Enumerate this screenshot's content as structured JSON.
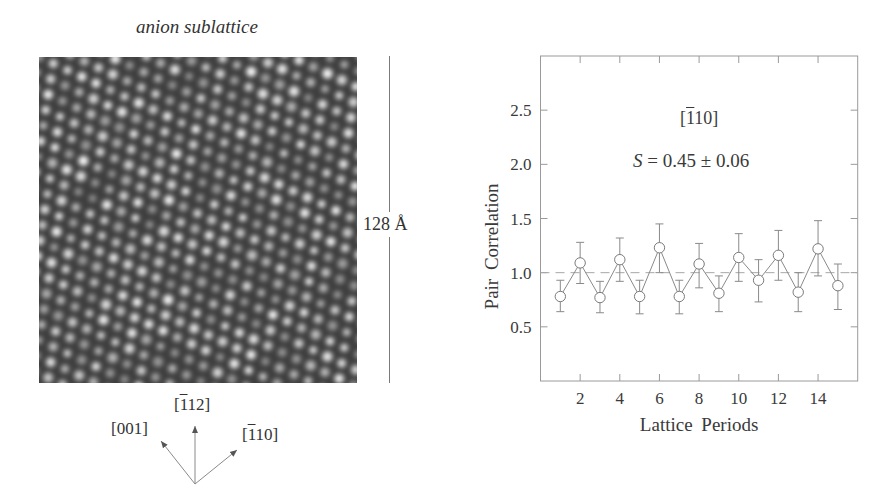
{
  "figure": {
    "left_panel": {
      "title": "anion sublattice",
      "scale_bar_label": "128 Å",
      "directions": [
        {
          "label_prefix": "[",
          "overline_digit": "1",
          "label_rest": "12]",
          "text": "[-112]"
        },
        {
          "label_prefix": "[",
          "overline_digit": "",
          "label_rest": "001]",
          "text": "[001]"
        },
        {
          "label_prefix": "[",
          "overline_digit": "1",
          "label_rest": "10]",
          "text": "[-110]"
        }
      ]
    },
    "right_panel": {
      "annotation_direction": {
        "prefix": "[",
        "overline_digit": "1",
        "rest": "10]"
      },
      "annotation_order": {
        "symbol": "S",
        "text": "= 0.45 ± 0.06"
      }
    }
  },
  "chart_data": {
    "type": "line",
    "title": "",
    "xlabel": "Lattice Periods",
    "ylabel": "Pair Correlation",
    "xlim": [
      0,
      16
    ],
    "ylim": [
      0,
      3
    ],
    "xticks": [
      2,
      4,
      6,
      8,
      10,
      12,
      14
    ],
    "xtick_labels": [
      "2",
      "4",
      "6",
      "8",
      "10",
      "12",
      "14"
    ],
    "yticks": [
      0.5,
      1.0,
      1.5,
      2.0,
      2.5
    ],
    "ytick_labels": [
      "0.5",
      "1.0",
      "1.5",
      "2.0",
      "2.5"
    ],
    "reference_line": {
      "y": 1.0,
      "style": "dashed"
    },
    "grid": false,
    "annotations": [
      "[-110]",
      "S = 0.45 ± 0.06"
    ],
    "series": [
      {
        "name": "[-110] pair correlation",
        "marker": "open-circle",
        "x": [
          1,
          2,
          3,
          4,
          5,
          6,
          7,
          8,
          9,
          10,
          11,
          12,
          13,
          14,
          15
        ],
        "y": [
          0.78,
          1.09,
          0.77,
          1.12,
          0.78,
          1.23,
          0.78,
          1.08,
          0.81,
          1.14,
          0.93,
          1.16,
          0.82,
          1.22,
          0.88
        ],
        "err_upper": [
          0.93,
          1.28,
          0.92,
          1.32,
          0.93,
          1.45,
          0.93,
          1.27,
          0.97,
          1.36,
          1.12,
          1.39,
          1.0,
          1.48,
          1.08
        ],
        "err_lower": [
          0.64,
          0.9,
          0.63,
          0.92,
          0.62,
          1.0,
          0.62,
          0.86,
          0.64,
          0.92,
          0.73,
          0.93,
          0.64,
          0.97,
          0.66
        ]
      }
    ],
    "colors": {
      "line": "#8a8a8a",
      "axis": "#9a9a9a",
      "text": "#3a3a3a"
    }
  }
}
